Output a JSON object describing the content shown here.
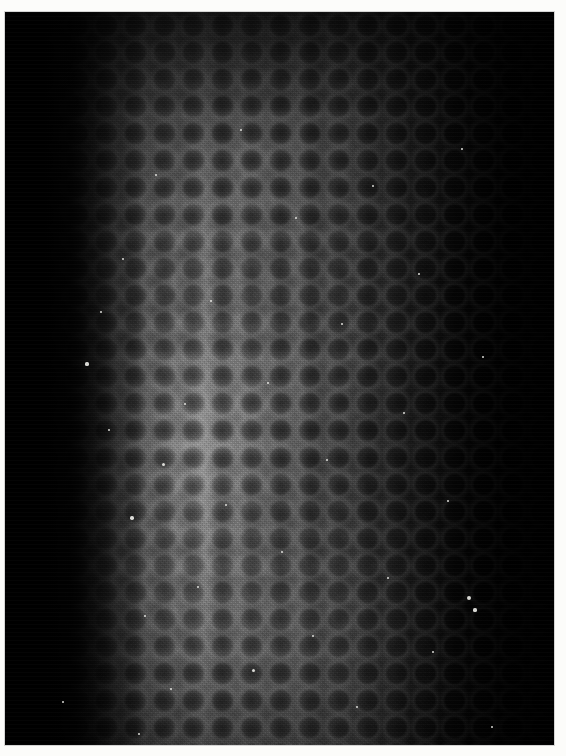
{
  "photo": {
    "title": "Macro photograph of a curved textured biological surface",
    "medium": "grayscale photographic print",
    "caption": "",
    "frame": {
      "paper_color": "#fcfcfa",
      "border_top": 12,
      "border_left": 5,
      "border_right": 12,
      "border_bottom": 11
    },
    "canvas": {
      "width": 566,
      "height": 756,
      "plate_width": 549,
      "plate_height": 733
    },
    "subject": {
      "description": "A cylindrical, convex specimen filling the frame, photographed close-up. Its surface is covered in a dense, regular pebbled or cellular pattern of dark rounded depressions separated by faintly lighter ridges.",
      "shape": "cylindrical / convex column running top to bottom",
      "texture_name": "pebbled-cellular",
      "cell_spacing_px": 29,
      "left_edge_curve": "dark silhouette edge that is widest at the top (about x=160) and narrows toward the bottom (about x=45)"
    },
    "lighting": {
      "type": "directional side light",
      "highlight_position": "left-of-center vertical band, brightest toward the lower third",
      "highlight_center_x_pct": 34,
      "highlight_center_y_pct": 62,
      "falloff": "falls rapidly to pure black at the left margin and gradually to near-black at the right margin"
    },
    "tones": {
      "background_black": "#000000",
      "shadow": "#0d0d0d",
      "dark_midtone": "#1e1e1e",
      "midtone": "#404040",
      "light_midtone": "#5e5e5e",
      "highlight": "#787878",
      "specular_speck": "#eeeeea",
      "paper_white": "#fcfcfa"
    },
    "features": [
      {
        "name": "black-left-margin",
        "region": "left 0-10% of plate",
        "tone": "#000000"
      },
      {
        "name": "illuminated-band",
        "region": "x 20%-55% of plate",
        "tone": "#5e5e5e"
      },
      {
        "name": "cellular-texture-field",
        "region": "x 25%-92% of plate",
        "tone": "#3a3a3a"
      },
      {
        "name": "dark-right-falloff",
        "region": "right 12% of plate",
        "tone": "#090909"
      },
      {
        "name": "specular-specks",
        "region": "scattered across the lit surface",
        "tone": "#eeeeea"
      }
    ],
    "specks": [
      {
        "x": 82,
        "y": 352,
        "r": 1.6
      },
      {
        "x": 96,
        "y": 300,
        "r": 1.2
      },
      {
        "x": 104,
        "y": 418,
        "r": 1.4
      },
      {
        "x": 118,
        "y": 247,
        "r": 1.1
      },
      {
        "x": 127,
        "y": 506,
        "r": 1.7
      },
      {
        "x": 140,
        "y": 604,
        "r": 1.3
      },
      {
        "x": 151,
        "y": 163,
        "r": 1.2
      },
      {
        "x": 158,
        "y": 452,
        "r": 1.5
      },
      {
        "x": 166,
        "y": 677,
        "r": 1.2
      },
      {
        "x": 180,
        "y": 392,
        "r": 1.1
      },
      {
        "x": 193,
        "y": 575,
        "r": 1.4
      },
      {
        "x": 206,
        "y": 289,
        "r": 1.0
      },
      {
        "x": 221,
        "y": 493,
        "r": 1.3
      },
      {
        "x": 236,
        "y": 118,
        "r": 1.1
      },
      {
        "x": 248,
        "y": 658,
        "r": 1.5
      },
      {
        "x": 263,
        "y": 371,
        "r": 1.0
      },
      {
        "x": 277,
        "y": 540,
        "r": 1.2
      },
      {
        "x": 291,
        "y": 206,
        "r": 1.1
      },
      {
        "x": 308,
        "y": 624,
        "r": 1.4
      },
      {
        "x": 322,
        "y": 448,
        "r": 1.0
      },
      {
        "x": 337,
        "y": 312,
        "r": 1.1
      },
      {
        "x": 352,
        "y": 695,
        "r": 1.3
      },
      {
        "x": 368,
        "y": 174,
        "r": 1.0
      },
      {
        "x": 383,
        "y": 566,
        "r": 1.2
      },
      {
        "x": 399,
        "y": 401,
        "r": 1.0
      },
      {
        "x": 414,
        "y": 262,
        "r": 0.9
      },
      {
        "x": 428,
        "y": 640,
        "r": 1.1
      },
      {
        "x": 443,
        "y": 489,
        "r": 1.0
      },
      {
        "x": 457,
        "y": 137,
        "r": 0.9
      },
      {
        "x": 470,
        "y": 598,
        "r": 1.6
      },
      {
        "x": 478,
        "y": 345,
        "r": 1.0
      },
      {
        "x": 487,
        "y": 715,
        "r": 1.2
      },
      {
        "x": 464,
        "y": 586,
        "r": 2.0
      },
      {
        "x": 134,
        "y": 722,
        "r": 1.3
      },
      {
        "x": 58,
        "y": 690,
        "r": 1.1
      }
    ]
  }
}
